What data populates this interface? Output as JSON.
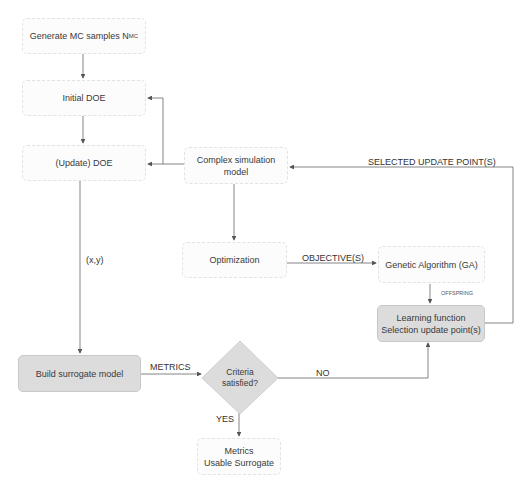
{
  "nodes": {
    "generate_mc": {
      "label": "Generate MC samples N",
      "subscript": "MC"
    },
    "initial_doe": {
      "label": "Initial DOE"
    },
    "update_doe": {
      "label": "(Update) DOE"
    },
    "complex_sim": {
      "line1": "Complex simulation",
      "line2": "model"
    },
    "optimization": {
      "label": "Optimization"
    },
    "genetic_algorithm": {
      "label": "Genetic Algorithm (GA)"
    },
    "learning_function": {
      "line1": "Learning function",
      "line2": "Selection update point(s)"
    },
    "build_surrogate": {
      "label": "Build surrogate model"
    },
    "criteria": {
      "line1": "Criteria",
      "line2": "satisfied?"
    },
    "metrics_usable": {
      "line1": "Metrics",
      "line2": "Usable Surrogate"
    }
  },
  "edge_labels": {
    "xy": "(x,y)",
    "objectives": "OBJECTIVE(S)",
    "selected_update": "SELECTED UPDATE POINT(S)",
    "offspring": "OFFSPRING",
    "metrics": "METRICS",
    "no": "NO",
    "yes": "YES"
  },
  "colors": {
    "shaded_fill": "#dcdcdc",
    "line": "#555555"
  }
}
